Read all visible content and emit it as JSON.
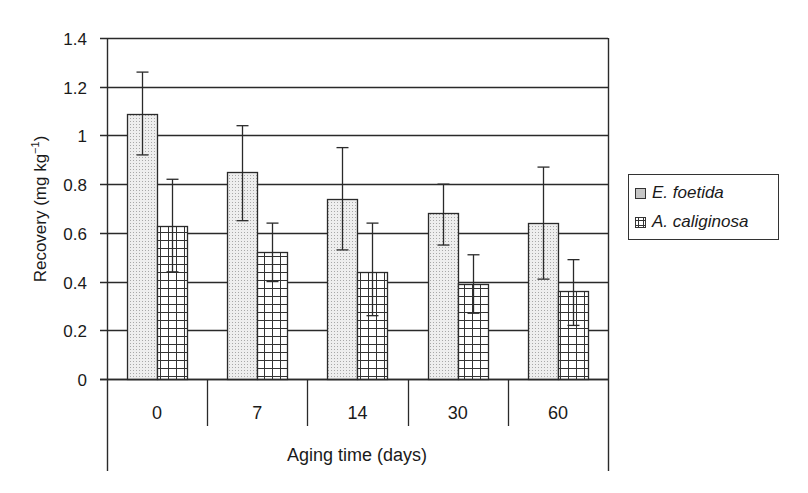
{
  "chart_data": {
    "type": "bar",
    "title": "",
    "xlabel": "Aging time (days)",
    "ylabel": "Recovery (mg kg⁻¹)",
    "ylabel_base": "Recovery (mg kg",
    "ylabel_sup": "−1",
    "ylabel_close": ")",
    "ylim": [
      0,
      1.4
    ],
    "yticks": [
      0,
      0.2,
      0.4,
      0.6,
      0.8,
      1,
      1.2,
      1.4
    ],
    "ytick_labels": [
      "0",
      "0.2",
      "0.4",
      "0.6",
      "0.8",
      "1",
      "1.2",
      "1.4"
    ],
    "grid": "horizontal",
    "legend_position": "right",
    "categories": [
      "0",
      "7",
      "14",
      "30",
      "60"
    ],
    "series": [
      {
        "name": "E. foetida",
        "pattern": "fine-dots",
        "values": [
          1.09,
          0.85,
          0.74,
          0.68,
          0.64
        ],
        "error_upper": [
          1.26,
          1.04,
          0.95,
          0.8,
          0.87
        ],
        "error_lower": [
          0.92,
          0.65,
          0.53,
          0.55,
          0.41
        ]
      },
      {
        "name": "A. caliginosa",
        "pattern": "grid",
        "values": [
          0.63,
          0.52,
          0.44,
          0.39,
          0.36
        ],
        "error_upper": [
          0.82,
          0.64,
          0.64,
          0.51,
          0.49
        ],
        "error_lower": [
          0.44,
          0.4,
          0.26,
          0.27,
          0.22
        ]
      }
    ]
  },
  "legend": {
    "items": [
      {
        "label": "E. foetida"
      },
      {
        "label": "A. caliginosa"
      }
    ]
  },
  "colors": {
    "axis": "#2a2a2a",
    "bar_outline": "#2a2a2a",
    "dot_fill": "#ebebeb",
    "grid_fill": "#ffffff"
  }
}
